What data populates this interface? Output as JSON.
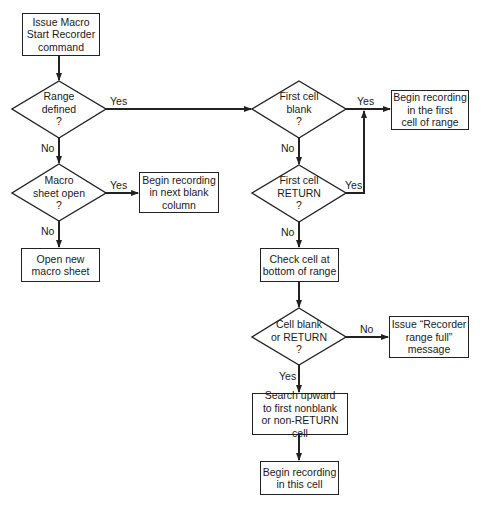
{
  "diagram": {
    "type": "flowchart",
    "nodes": {
      "start": {
        "shape": "process",
        "text": "Issue Macro\nStart Recorder\ncommand"
      },
      "range_defined": {
        "shape": "decision",
        "text": "Range\ndefined\n?"
      },
      "macro_sheet_open": {
        "shape": "decision",
        "text": "Macro\nsheet open\n?"
      },
      "begin_next_blank_column": {
        "shape": "process",
        "text": "Begin recording\nin next blank\ncolumn"
      },
      "open_new_macro_sheet": {
        "shape": "process",
        "text": "Open new\nmacro sheet"
      },
      "first_cell_blank": {
        "shape": "decision",
        "text": "First cell\nblank\n?"
      },
      "begin_first_cell_of_range": {
        "shape": "process",
        "text": "Begin recording\nin the first\ncell of range"
      },
      "first_cell_return": {
        "shape": "decision",
        "text": "First cell\nRETURN\n?"
      },
      "check_bottom_cell": {
        "shape": "process",
        "text": "Check cell at\nbottom of range"
      },
      "cell_blank_or_return": {
        "shape": "decision",
        "text": "Cell blank\nor RETURN\n?"
      },
      "range_full_message": {
        "shape": "process",
        "text": "Issue “Recorder\nrange full”\nmessage"
      },
      "search_upward": {
        "shape": "process",
        "text": "Search upward\nto first nonblank\nor non-RETURN cell"
      },
      "begin_this_cell": {
        "shape": "process",
        "text": "Begin recording\nin this cell"
      }
    },
    "edges": {
      "range_yes": "Yes",
      "range_no": "No",
      "macro_yes": "Yes",
      "macro_no": "No",
      "first_blank_yes": "Yes",
      "first_blank_no": "No",
      "first_return_yes": "Yes",
      "first_return_no": "No",
      "cell_check_no": "No",
      "cell_check_yes": "Yes"
    },
    "colors": {
      "stroke": "#222222",
      "background": "#ffffff",
      "text": "#1a1a1a"
    }
  }
}
